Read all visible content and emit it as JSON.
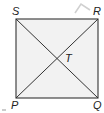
{
  "diagram": {
    "type": "square with diagonals",
    "vertices": {
      "S": {
        "label": "S",
        "position": "top-left"
      },
      "R": {
        "label": "R",
        "position": "top-right"
      },
      "P": {
        "label": "P",
        "position": "bottom-left"
      },
      "Q": {
        "label": "Q",
        "position": "bottom-right"
      }
    },
    "intersection": {
      "label": "T"
    },
    "segments": [
      "SR",
      "RQ",
      "QP",
      "PS",
      "SQ",
      "PR"
    ],
    "colors": {
      "fill": "#f2f2f2",
      "stroke": "#333333",
      "artifact": "#c8c8c8"
    }
  }
}
